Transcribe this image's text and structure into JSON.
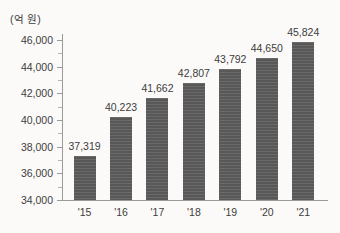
{
  "chart_data": {
    "type": "bar",
    "title": "",
    "subtitle": "",
    "unit_label": "(억 원)",
    "xlabel": "",
    "ylabel": "",
    "categories": [
      "'15",
      "'16",
      "'17",
      "'18",
      "'19",
      "'20",
      "'21"
    ],
    "values": [
      37319,
      40223,
      41662,
      42807,
      43792,
      44650,
      45824
    ],
    "value_labels": [
      "37,319",
      "40,223",
      "41,662",
      "42,807",
      "43,792",
      "44,650",
      "45,824"
    ],
    "series": [
      {
        "name": "",
        "values": [
          37319,
          40223,
          41662,
          42807,
          43792,
          44650,
          45824
        ]
      }
    ],
    "ylim": [
      34000,
      46000
    ],
    "y_ticks": [
      34000,
      36000,
      38000,
      40000,
      42000,
      44000,
      46000
    ],
    "y_tick_labels": [
      "34,000",
      "36,000",
      "38,000",
      "40,000",
      "42,000",
      "44,000",
      "46,000"
    ],
    "y_minor_tick_interval": 1000,
    "grid": false,
    "legend": false,
    "legend_position": "none",
    "bar_color": "#585858",
    "axis_color": "#9a9a98",
    "text_color": "#3d3d3d",
    "background_color": "#fbfaf8"
  }
}
